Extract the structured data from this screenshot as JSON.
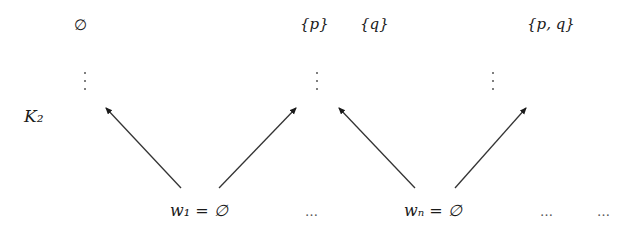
{
  "diagram": {
    "model_label": "K₂",
    "top_nodes": [
      {
        "label": "∅"
      },
      {
        "label": "{p}"
      },
      {
        "label": "{q}"
      },
      {
        "label": "{p, q}"
      }
    ],
    "bottom_nodes": [
      {
        "label": "w₁ = ∅"
      },
      {
        "label": "wₙ = ∅"
      }
    ],
    "ellipses": [
      "…",
      "…",
      "…"
    ],
    "edges": [
      {
        "from": "w₁ = ∅",
        "to": "∅ (via vertical dots)"
      },
      {
        "from": "w₁ = ∅",
        "to": "{p}"
      },
      {
        "from": "wₙ = ∅",
        "to": "{p}"
      },
      {
        "from": "wₙ = ∅",
        "to": "{p, q}"
      }
    ],
    "colors": {
      "ink": "#1a1a1a",
      "background": "#ffffff"
    }
  }
}
